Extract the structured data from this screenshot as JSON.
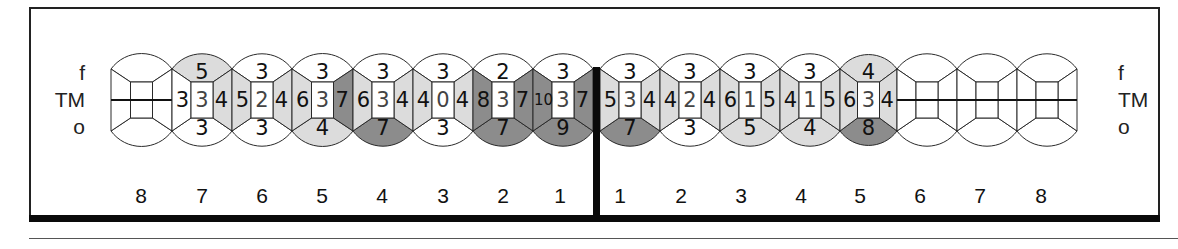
{
  "diagram": {
    "row_labels": {
      "top": "f",
      "middle": "TM",
      "bottom": "o"
    },
    "legend_colors": {
      "white": "#ffffff",
      "light": "#dcdcdc",
      "dark": "#8c8c8c",
      "line": "#2a2a2a"
    },
    "left_quadrant": {
      "tooth_numbers": [
        "8",
        "7",
        "6",
        "5",
        "4",
        "3",
        "2",
        "1"
      ],
      "teeth": [
        {
          "number": "8",
          "missing": true
        },
        {
          "number": "7",
          "f": "5",
          "f_shade": "light",
          "mesial": "3",
          "mesial_shade": "white",
          "center": "3",
          "distal": "4",
          "distal_shade": "light",
          "o": "3",
          "o_shade": "white"
        },
        {
          "number": "6",
          "f": "3",
          "f_shade": "white",
          "mesial": "5",
          "mesial_shade": "light",
          "center": "2",
          "distal": "4",
          "distal_shade": "light",
          "o": "3",
          "o_shade": "white"
        },
        {
          "number": "5",
          "f": "3",
          "f_shade": "white",
          "mesial": "6",
          "mesial_shade": "light",
          "center": "3",
          "distal": "7",
          "distal_shade": "dark",
          "o": "4",
          "o_shade": "light"
        },
        {
          "number": "4",
          "f": "3",
          "f_shade": "white",
          "mesial": "6",
          "mesial_shade": "light",
          "center": "3",
          "distal": "4",
          "distal_shade": "light",
          "o": "7",
          "o_shade": "dark"
        },
        {
          "number": "3",
          "f": "3",
          "f_shade": "white",
          "mesial": "4",
          "mesial_shade": "light",
          "center": "0",
          "distal": "4",
          "distal_shade": "light",
          "o": "3",
          "o_shade": "white"
        },
        {
          "number": "2",
          "f": "2",
          "f_shade": "white",
          "mesial": "8",
          "mesial_shade": "dark",
          "center": "3",
          "distal": "7",
          "distal_shade": "dark",
          "o": "7",
          "o_shade": "dark"
        },
        {
          "number": "1",
          "f": "3",
          "f_shade": "white",
          "mesial": "10",
          "mesial_shade": "dark",
          "center": "3",
          "distal": "7",
          "distal_shade": "dark",
          "o": "9",
          "o_shade": "dark"
        }
      ]
    },
    "right_quadrant": {
      "tooth_numbers": [
        "1",
        "2",
        "3",
        "4",
        "5",
        "6",
        "7",
        "8"
      ],
      "teeth": [
        {
          "number": "1",
          "f": "3",
          "f_shade": "white",
          "mesial": "4",
          "mesial_shade": "light",
          "center": "3",
          "distal": "5",
          "distal_shade": "light",
          "o": "7",
          "o_shade": "dark"
        },
        {
          "number": "2",
          "f": "3",
          "f_shade": "white",
          "mesial": "4",
          "mesial_shade": "light",
          "center": "2",
          "distal": "4",
          "distal_shade": "light",
          "o": "3",
          "o_shade": "white"
        },
        {
          "number": "3",
          "f": "3",
          "f_shade": "white",
          "mesial": "5",
          "mesial_shade": "light",
          "center": "1",
          "distal": "6",
          "distal_shade": "light",
          "o": "5",
          "o_shade": "light"
        },
        {
          "number": "4",
          "f": "3",
          "f_shade": "white",
          "mesial": "5",
          "mesial_shade": "light",
          "center": "1",
          "distal": "4",
          "distal_shade": "light",
          "o": "4",
          "o_shade": "light"
        },
        {
          "number": "5",
          "f": "4",
          "f_shade": "light",
          "mesial": "4",
          "mesial_shade": "light",
          "center": "3",
          "distal": "6",
          "distal_shade": "light",
          "o": "8",
          "o_shade": "dark"
        },
        {
          "number": "6",
          "missing": true
        },
        {
          "number": "7",
          "missing": true
        },
        {
          "number": "8",
          "missing": true
        }
      ]
    }
  }
}
